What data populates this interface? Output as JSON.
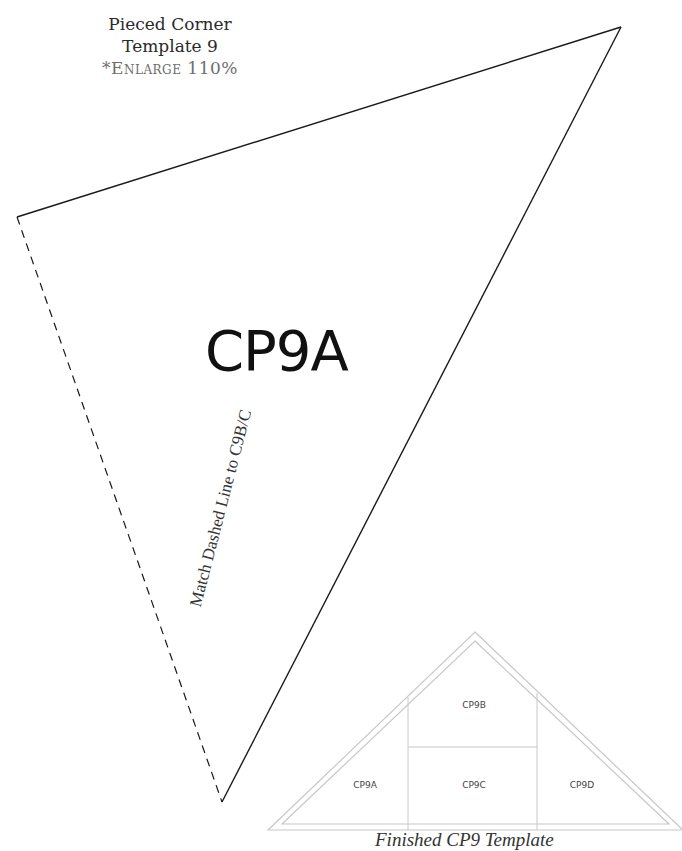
{
  "header": {
    "title_line1": "Pieced Corner",
    "title_line2": "Template 9",
    "note": "*Enlarge 110%"
  },
  "template_piece": {
    "label": "CP9A",
    "vertices": {
      "top_right": [
        621,
        27
      ],
      "left": [
        17,
        217
      ],
      "bottom": [
        222,
        802
      ]
    },
    "dashed_edge_label": "Match Dashed Line to C9B/C"
  },
  "finished_diagram": {
    "caption": "Finished CP9 Template",
    "pieces": [
      {
        "id": "CP9A",
        "label": "CP9A"
      },
      {
        "id": "CP9B",
        "label": "CP9B"
      },
      {
        "id": "CP9C",
        "label": "CP9C"
      },
      {
        "id": "CP9D",
        "label": "CP9D"
      }
    ],
    "line_color": "#c8c8c8"
  },
  "colors": {
    "outline": "#1a1a1a",
    "note_gray": "#6e6e6e"
  }
}
